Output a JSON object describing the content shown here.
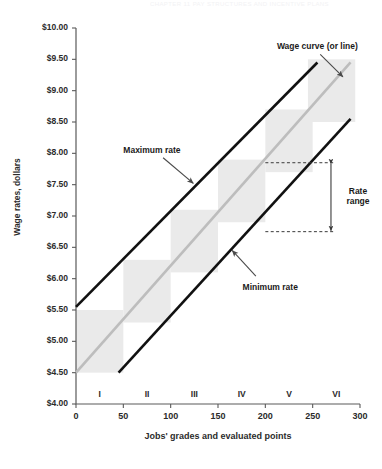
{
  "page": {
    "header_fragment": "CHAPTER 11   PAY STRUCTURES AND INCENTIVE PLANS"
  },
  "chart_data": {
    "type": "line",
    "title": "",
    "xlabel": "Jobs' grades and evaluated points",
    "ylabel": "Wage rates, dollars",
    "xlim": [
      0,
      300
    ],
    "ylim": [
      4.0,
      10.0
    ],
    "grid": false,
    "legend": "none",
    "xticks": [
      {
        "value": 0,
        "label": "0"
      },
      {
        "value": 50,
        "label": "50"
      },
      {
        "value": 100,
        "label": "100"
      },
      {
        "value": 150,
        "label": "150"
      },
      {
        "value": 200,
        "label": "200"
      },
      {
        "value": 250,
        "label": "250"
      },
      {
        "value": 300,
        "label": "300"
      }
    ],
    "yticks": [
      {
        "value": 10.0,
        "label": "$10.00"
      },
      {
        "value": 9.5,
        "label": "$9.50"
      },
      {
        "value": 9.0,
        "label": "$9.00"
      },
      {
        "value": 8.5,
        "label": "$8.50"
      },
      {
        "value": 8.0,
        "label": "$8.00"
      },
      {
        "value": 7.5,
        "label": "$7.50"
      },
      {
        "value": 7.0,
        "label": "$7.00"
      },
      {
        "value": 6.5,
        "label": "$6.50"
      },
      {
        "value": 6.0,
        "label": "$6.00"
      },
      {
        "value": 5.5,
        "label": "$5.50"
      },
      {
        "value": 5.0,
        "label": "$5.00"
      },
      {
        "value": 4.5,
        "label": "$4.50"
      },
      {
        "value": 4.0,
        "label": "$4.00"
      }
    ],
    "grade_labels": [
      {
        "label": "I",
        "center": 25
      },
      {
        "label": "II",
        "center": 75
      },
      {
        "label": "III",
        "center": 125
      },
      {
        "label": "IV",
        "center": 175
      },
      {
        "label": "V",
        "center": 225
      },
      {
        "label": "VI",
        "center": 275
      }
    ],
    "series": [
      {
        "name": "Maximum rate",
        "color": "#111111",
        "width": 2.6,
        "points": [
          [
            0,
            5.55
          ],
          [
            255,
            9.45
          ]
        ]
      },
      {
        "name": "Wage curve (or line)",
        "color": "#bdbdbd",
        "width": 2.6,
        "points": [
          [
            0,
            4.5
          ],
          [
            290,
            9.45
          ]
        ]
      },
      {
        "name": "Minimum rate",
        "color": "#111111",
        "width": 2.6,
        "points": [
          [
            45,
            4.5
          ],
          [
            290,
            8.55
          ]
        ]
      }
    ],
    "grade_boxes": [
      {
        "grade": "I",
        "x0": 0,
        "x1": 50,
        "y0": 4.5,
        "y1": 5.5
      },
      {
        "grade": "II",
        "x0": 50,
        "x1": 100,
        "y0": 5.3,
        "y1": 6.3
      },
      {
        "grade": "III",
        "x0": 100,
        "x1": 150,
        "y0": 6.1,
        "y1": 7.1
      },
      {
        "grade": "IV",
        "x0": 150,
        "x1": 200,
        "y0": 6.9,
        "y1": 7.9
      },
      {
        "grade": "V",
        "x0": 200,
        "x1": 250,
        "y0": 7.7,
        "y1": 8.7
      },
      {
        "grade": "VI",
        "x0": 245,
        "x1": 295,
        "y0": 8.5,
        "y1": 9.5
      }
    ],
    "box_color": "#eaeaea",
    "rate_range": {
      "label_line1": "Rate",
      "label_line2": "range",
      "upper_value": 7.85,
      "lower_value": 6.75,
      "dash_x_start": 200,
      "dash_x_end": 263
    },
    "annotations": [
      {
        "name": "wage-curve",
        "text": "Wage curve (or line)",
        "text_x": 255,
        "text_y": 9.72,
        "arrow_from": [
          258,
          9.58
        ],
        "arrow_to": [
          282,
          9.22
        ]
      },
      {
        "name": "maximum-rate",
        "text": "Maximum rate",
        "text_x": 50,
        "text_y": 8.06,
        "arrow_from": [
          92,
          7.93
        ],
        "arrow_to": [
          124,
          7.52
        ]
      },
      {
        "name": "minimum-rate",
        "text": "Minimum rate",
        "text_x": 176,
        "text_y": 5.87,
        "arrow_from": [
          190,
          6.04
        ],
        "arrow_to": [
          165,
          6.45
        ]
      }
    ]
  }
}
